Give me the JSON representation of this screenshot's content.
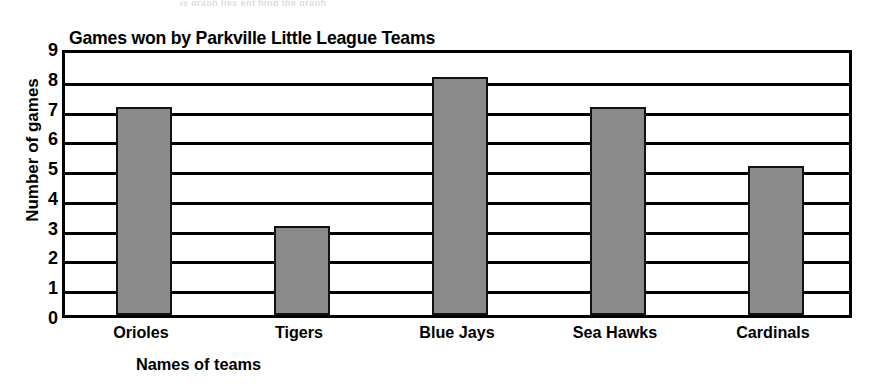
{
  "scan_artifact": "is graph lies ent hing the graph",
  "chart_data": {
    "type": "bar",
    "title": "Games won by Parkville Little League Teams",
    "xlabel": "Names of teams",
    "ylabel": "Number of games",
    "categories": [
      "Orioles",
      "Tigers",
      "Blue Jays",
      "Sea Hawks",
      "Cardinals"
    ],
    "values": [
      7,
      3,
      8,
      7,
      5
    ],
    "ylim": [
      0,
      9
    ],
    "ytick_labels": [
      "0",
      "1",
      "2",
      "3",
      "4",
      "5",
      "6",
      "7",
      "8",
      "9"
    ],
    "grid": true,
    "legend": "none",
    "bar_color": "#8a8a8a",
    "bar_edge_color": "#111111",
    "axis_color": "#000000",
    "background_color": "#ffffff"
  }
}
